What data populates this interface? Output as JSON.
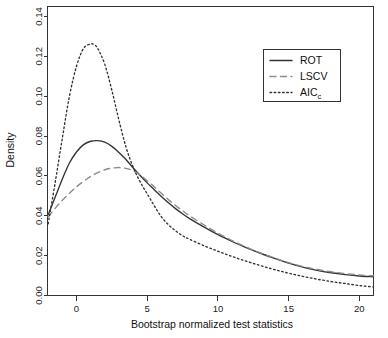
{
  "chart_data": {
    "type": "line",
    "title": "",
    "xlabel": "Bootstrap normalized test statistics",
    "ylabel": "Density",
    "xlim": [
      -2.05,
      21.0
    ],
    "ylim": [
      0.0,
      0.145
    ],
    "xticks": [
      0,
      5,
      10,
      15,
      20
    ],
    "xtick_labels": [
      "0",
      "5",
      "10",
      "15",
      "20"
    ],
    "yticks": [
      0.0,
      0.02,
      0.04,
      0.06,
      0.08,
      0.1,
      0.12,
      0.14
    ],
    "ytick_labels": [
      "0.00",
      "0.02",
      "0.04",
      "0.06",
      "0.08",
      "0.10",
      "0.12",
      "0.14"
    ],
    "grid": false,
    "legend_position": "top-right",
    "series": [
      {
        "name": "ROT",
        "label": "ROT",
        "style": "solid",
        "color": "#333333",
        "x": [
          -2.0,
          -1.5,
          -1.0,
          -0.5,
          0.0,
          0.5,
          1.0,
          1.5,
          2.0,
          2.5,
          3.0,
          3.5,
          4.0,
          4.5,
          5.0,
          5.5,
          6.0,
          6.5,
          7.0,
          7.5,
          8.0,
          9.0,
          10.0,
          11.0,
          12.0,
          13.0,
          14.0,
          15.0,
          16.0,
          17.0,
          18.0,
          19.0,
          20.0,
          21.0
        ],
        "y": [
          0.0405,
          0.0495,
          0.0585,
          0.0665,
          0.072,
          0.0757,
          0.0774,
          0.0777,
          0.0769,
          0.0748,
          0.0718,
          0.0682,
          0.0641,
          0.0602,
          0.0565,
          0.0531,
          0.0497,
          0.0465,
          0.0436,
          0.041,
          0.0386,
          0.0344,
          0.0305,
          0.0271,
          0.024,
          0.0212,
          0.0186,
          0.0162,
          0.0142,
          0.0126,
          0.0114,
          0.0105,
          0.0098,
          0.0094
        ]
      },
      {
        "name": "LSCV",
        "label": "LSCV",
        "style": "dashed",
        "color": "#8c8c8c",
        "x": [
          -2.0,
          -1.5,
          -1.0,
          -0.5,
          0.0,
          0.5,
          1.0,
          1.5,
          2.0,
          2.5,
          3.0,
          3.5,
          4.0,
          4.5,
          5.0,
          5.5,
          6.0,
          6.5,
          7.0,
          7.5,
          8.0,
          9.0,
          10.0,
          11.0,
          12.0,
          13.0,
          14.0,
          15.0,
          16.0,
          17.0,
          18.0,
          19.0,
          20.0,
          21.0
        ],
        "y": [
          0.0395,
          0.0438,
          0.0478,
          0.0513,
          0.0545,
          0.0573,
          0.0597,
          0.0616,
          0.0631,
          0.0639,
          0.0642,
          0.0638,
          0.0626,
          0.0605,
          0.0576,
          0.0545,
          0.0513,
          0.0481,
          0.0452,
          0.0425,
          0.04,
          0.0355,
          0.0313,
          0.0276,
          0.0243,
          0.0214,
          0.0188,
          0.0165,
          0.0146,
          0.0131,
          0.0119,
          0.011,
          0.0103,
          0.0099
        ]
      },
      {
        "name": "AICc",
        "label": "AIC",
        "label_sub": "c",
        "style": "dotted",
        "color": "#333333",
        "x": [
          -2.0,
          -1.5,
          -1.0,
          -0.5,
          0.0,
          0.5,
          1.0,
          1.25,
          1.5,
          2.0,
          2.5,
          3.0,
          3.5,
          4.0,
          4.5,
          5.0,
          5.5,
          6.0,
          6.5,
          7.0,
          7.5,
          8.0,
          9.0,
          10.0,
          11.0,
          12.0,
          13.0,
          14.0,
          15.0,
          16.0,
          17.0,
          18.0,
          19.0,
          20.0,
          21.0
        ],
        "y": [
          0.036,
          0.057,
          0.079,
          0.1,
          0.115,
          0.124,
          0.1262,
          0.1258,
          0.124,
          0.116,
          0.103,
          0.088,
          0.0745,
          0.0645,
          0.057,
          0.051,
          0.045,
          0.0395,
          0.0355,
          0.0325,
          0.03,
          0.0282,
          0.025,
          0.0222,
          0.0196,
          0.0172,
          0.015,
          0.013,
          0.0112,
          0.0096,
          0.0082,
          0.007,
          0.006,
          0.005,
          0.0043
        ]
      }
    ]
  },
  "axis": {
    "y_title": "Density",
    "x_title": "Bootstrap normalized test statistics"
  },
  "legend": {
    "items": [
      {
        "label": "ROT",
        "sub": "",
        "style": "solid"
      },
      {
        "label": "LSCV",
        "sub": "",
        "style": "dashed"
      },
      {
        "label": "AIC",
        "sub": "c",
        "style": "dotted"
      }
    ]
  },
  "colors": {
    "solid_curve": "#333333",
    "dashed_curve": "#8c8c8c",
    "dotted_curve": "#333333",
    "axis": "#333333",
    "background": "#ffffff"
  }
}
